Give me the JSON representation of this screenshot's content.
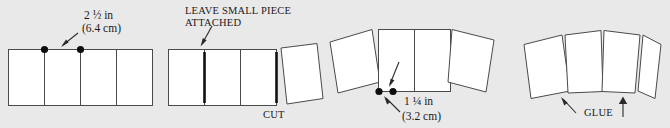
{
  "figure": {
    "background_color": "#e9e9e9",
    "panel_fill": "#ffffff",
    "panel_stroke": "#4a4a4a",
    "cut_bar_color": "#111111",
    "dot_color": "#0d0d0d",
    "arrow_color": "#2a2a2a"
  },
  "steps": [
    {
      "id": "step-1",
      "name": "mark-spine-width",
      "panel_count": 4,
      "dot_count": 2,
      "callout": {
        "line1_value": "2",
        "line1_fraction": "½",
        "line1_unit": "in",
        "line1_full": "2 ½ in",
        "line2": "(6.4 cm)"
      }
    },
    {
      "id": "step-2",
      "name": "cut-leave-small-piece",
      "panel_count": 4,
      "cut_bar_count": 2,
      "callout_top_line1": "LEAVE SMALL PIECE",
      "callout_top_line2": "ATTACHED",
      "callout_bottom": "CUT"
    },
    {
      "id": "step-3",
      "name": "measure-narrow-spine",
      "panel_count": 4,
      "dot_count": 2,
      "callout": {
        "line1_value": "1",
        "line1_fraction": "¼",
        "line1_unit": "in",
        "line1_full": "1 ¼ in",
        "line2": "(3.2 cm)"
      }
    },
    {
      "id": "step-4",
      "name": "glue-panels",
      "panel_count": 4,
      "callout": "GLUE"
    }
  ]
}
